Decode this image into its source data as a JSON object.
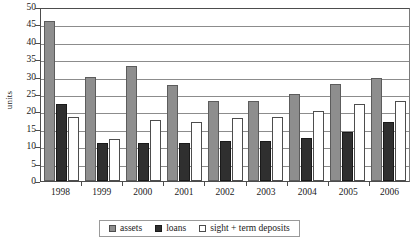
{
  "chart_data": {
    "type": "bar",
    "title": "",
    "xlabel": "",
    "ylabel": "units",
    "ylim": [
      0,
      50
    ],
    "ytick_step": 5,
    "yticks": [
      50,
      45,
      40,
      35,
      30,
      25,
      20,
      15,
      10,
      5,
      0
    ],
    "grid": true,
    "legend_position": "bottom-center",
    "categories": [
      "1998",
      "1999",
      "2000",
      "2001",
      "2002",
      "2003",
      "2004",
      "2005",
      "2006"
    ],
    "series": [
      {
        "name": "assets",
        "color": "#8e8e8e",
        "values": [
          46,
          30,
          33,
          27.5,
          23,
          23,
          25,
          28,
          29.5
        ]
      },
      {
        "name": "loans",
        "color": "#2f2f2f",
        "values": [
          22,
          11,
          11,
          11,
          11.5,
          11.5,
          12.5,
          14,
          17
        ]
      },
      {
        "name": "sight + term deposits",
        "color": "#ffffff",
        "values": [
          18.5,
          12,
          17.5,
          17,
          18,
          18.5,
          20,
          22,
          23
        ]
      }
    ]
  },
  "axis": {
    "y_title": "units"
  },
  "legend": {
    "items": [
      {
        "label": "assets",
        "key": "assets"
      },
      {
        "label": "loans",
        "key": "loans"
      },
      {
        "label": "sight + term deposits",
        "key": "deposits"
      }
    ]
  }
}
